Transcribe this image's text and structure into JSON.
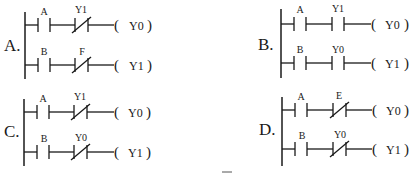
{
  "options": [
    {
      "label": "A.",
      "rungs": [
        {
          "contact1": {
            "name": "A",
            "type": "NO"
          },
          "contact2": {
            "name": "Y1",
            "type": "NC"
          },
          "coil": "Y0"
        },
        {
          "contact1": {
            "name": "B",
            "type": "NO"
          },
          "contact2": {
            "name": "F",
            "type": "NC"
          },
          "coil": "Y1"
        }
      ]
    },
    {
      "label": "B.",
      "rungs": [
        {
          "contact1": {
            "name": "A",
            "type": "NO"
          },
          "contact2": {
            "name": "Y1",
            "type": "NO"
          },
          "coil": "Y0"
        },
        {
          "contact1": {
            "name": "B",
            "type": "NO"
          },
          "contact2": {
            "name": "Y0",
            "type": "NO"
          },
          "coil": "Y1"
        }
      ]
    },
    {
      "label": "C.",
      "rungs": [
        {
          "contact1": {
            "name": "A",
            "type": "NO"
          },
          "contact2": {
            "name": "Y1",
            "type": "NC"
          },
          "coil": "Y0"
        },
        {
          "contact1": {
            "name": "B",
            "type": "NO"
          },
          "contact2": {
            "name": "Y0",
            "type": "NC"
          },
          "coil": "Y1"
        }
      ]
    },
    {
      "label": "D.",
      "rungs": [
        {
          "contact1": {
            "name": "A",
            "type": "NO"
          },
          "contact2": {
            "name": "E",
            "type": "NC"
          },
          "coil": "Y0"
        },
        {
          "contact1": {
            "name": "B",
            "type": "NO"
          },
          "contact2": {
            "name": "Y0",
            "type": "NC"
          },
          "coil": "Y1"
        }
      ]
    }
  ],
  "symbols": {
    "coil_open": "(",
    "coil_close": ")"
  }
}
